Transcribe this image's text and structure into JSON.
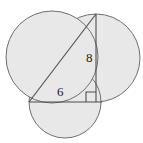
{
  "figure": {
    "canvas": {
      "width": 143,
      "height": 143,
      "background": "#ffffff"
    },
    "style": {
      "fill": "#e8e8e8",
      "stroke": "#6f6f6f",
      "triangle_stroke": "#4d4d4d",
      "label_color": "#1a1a1a",
      "stroke_width": 1
    },
    "labels": {
      "vertical_side": "8",
      "horizontal_side": "6"
    },
    "triangle": {
      "vertices": {
        "apex": {
          "x": 96,
          "y": 14
        },
        "right_angle": {
          "x": 96,
          "y": 102
        },
        "left": {
          "x": 29,
          "y": 102
        }
      },
      "right_angle_marker": {
        "x": 86,
        "y": 92,
        "size": 10
      }
    },
    "circles": [
      {
        "name": "hypotenuse-circle",
        "cx": 52,
        "cy": 57,
        "r": 46
      },
      {
        "name": "vertical-side-circle",
        "cx": 96,
        "cy": 58,
        "r": 44
      },
      {
        "name": "horizontal-side-circle",
        "cx": 65,
        "cy": 102,
        "r": 36
      }
    ]
  }
}
